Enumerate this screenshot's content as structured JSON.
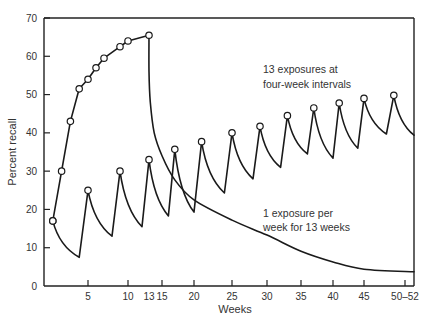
{
  "chart_data": {
    "type": "line",
    "title": "",
    "xlabel": "Weeks",
    "ylabel": "Percent recall",
    "ylim": [
      0,
      70
    ],
    "xlim": [
      0,
      52
    ],
    "grid": false,
    "y_ticks": [
      0,
      10,
      20,
      30,
      40,
      50,
      60,
      70
    ],
    "x_ticks": [
      {
        "week": 5,
        "label": "5"
      },
      {
        "week": 10,
        "label": "10"
      },
      {
        "week": 13,
        "label": "13"
      },
      {
        "week": 15,
        "label": "15"
      },
      {
        "week": 20,
        "label": "20"
      },
      {
        "week": 25,
        "label": "25"
      },
      {
        "week": 30,
        "label": "30"
      },
      {
        "week": 35,
        "label": "35"
      },
      {
        "week": 40,
        "label": "40"
      },
      {
        "week": 45,
        "label": "45"
      },
      {
        "week": 50.5,
        "label": "50–52"
      }
    ],
    "annotations": [
      {
        "lines": [
          "13 exposures at",
          "four-week intervals"
        ],
        "series": "four_week"
      },
      {
        "lines": [
          "1 exposure per",
          "week for 13 weeks"
        ],
        "series": "weekly"
      }
    ],
    "series": [
      {
        "name": "1 exposure per week for 13 weeks",
        "id": "weekly",
        "exposures": [
          {
            "week": 1,
            "recall": 17
          },
          {
            "week": 2,
            "recall": 30
          },
          {
            "week": 3,
            "recall": 43
          },
          {
            "week": 4,
            "recall": 51.5
          },
          {
            "week": 5,
            "recall": 54
          },
          {
            "week": 6,
            "recall": 57
          },
          {
            "week": 7,
            "recall": 59.5
          },
          {
            "week": 9,
            "recall": 62.5
          },
          {
            "week": 10,
            "recall": 64
          },
          {
            "week": 13,
            "recall": 65.5
          }
        ],
        "decay": [
          {
            "week": 13,
            "recall": 65.5
          },
          {
            "week": 13,
            "recall": 56
          },
          {
            "week": 13.2,
            "recall": 48
          },
          {
            "week": 13.8,
            "recall": 40
          },
          {
            "week": 15,
            "recall": 34
          },
          {
            "week": 17,
            "recall": 27.7
          },
          {
            "week": 20,
            "recall": 22.5
          },
          {
            "week": 25,
            "recall": 17.2
          },
          {
            "week": 30,
            "recall": 13.3
          },
          {
            "week": 35,
            "recall": 9.1
          },
          {
            "week": 40,
            "recall": 6.3
          },
          {
            "week": 45,
            "recall": 4.4
          },
          {
            "week": 52,
            "recall": 3.7
          }
        ]
      },
      {
        "name": "13 exposures at four-week intervals",
        "id": "four_week",
        "peaks": [
          {
            "week": 1,
            "recall": 17
          },
          {
            "week": 5,
            "recall": 25
          },
          {
            "week": 9,
            "recall": 30
          },
          {
            "week": 13,
            "recall": 33
          },
          {
            "week": 17,
            "recall": 35.7
          },
          {
            "week": 21,
            "recall": 37.7
          },
          {
            "week": 25,
            "recall": 40
          },
          {
            "week": 29,
            "recall": 41.7
          },
          {
            "week": 33,
            "recall": 44.5
          },
          {
            "week": 37,
            "recall": 46.5
          },
          {
            "week": 41,
            "recall": 47.8
          },
          {
            "week": 45,
            "recall": 49
          },
          {
            "week": 49,
            "recall": 49.8
          }
        ],
        "troughs": [
          {
            "week": 4,
            "recall": 7.5
          },
          {
            "week": 8,
            "recall": 13
          },
          {
            "week": 12,
            "recall": 15.5
          },
          {
            "week": 16,
            "recall": 18.3
          },
          {
            "week": 20,
            "recall": 19.3
          },
          {
            "week": 24,
            "recall": 24.3
          },
          {
            "week": 28,
            "recall": 28
          },
          {
            "week": 32,
            "recall": 31
          },
          {
            "week": 36,
            "recall": 34.5
          },
          {
            "week": 40,
            "recall": 33.4
          },
          {
            "week": 44,
            "recall": 36
          },
          {
            "week": 48,
            "recall": 39.7
          }
        ],
        "end": {
          "week": 52,
          "recall": 39.4
        }
      }
    ]
  }
}
